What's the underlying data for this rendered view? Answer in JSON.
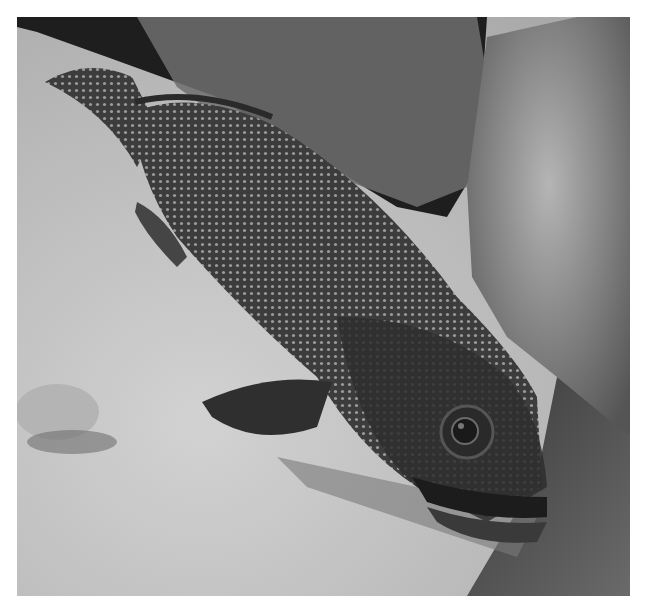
{
  "image": {
    "description": "Black-and-white underwater photograph of a spotted grouper resting on a sandy sea floor beside coral/algae-covered rocks",
    "subject": "grouper fish",
    "palette": {
      "sand": "#c4c4c4",
      "sand_shadow": "#8a8a8a",
      "dark_background": "#1e1e1e",
      "coral": "#9a9a9a",
      "fish_body": "#3a3a3a",
      "fish_head": "#2e2e2e"
    }
  }
}
